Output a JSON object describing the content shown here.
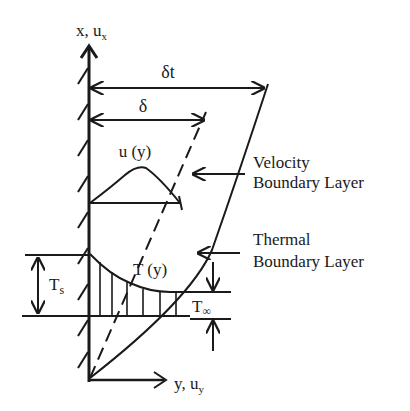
{
  "diagram": {
    "axes": {
      "vertical": {
        "main": "x, u",
        "sub": "x"
      },
      "horizontal": {
        "main": "y, u",
        "sub": "y"
      }
    },
    "dimensions": {
      "thermal_thickness": "δt",
      "velocity_thickness": "δ"
    },
    "profiles": {
      "velocity": "u (y)",
      "temperature": "T (y)"
    },
    "callouts": {
      "velocity_bl": [
        "Velocity",
        "Boundary Layer"
      ],
      "thermal_bl": [
        "Thermal",
        "Boundary Layer"
      ]
    },
    "temperatures": {
      "surface": {
        "main": "T",
        "sub": "s"
      },
      "freestream": {
        "main": "T",
        "sub": "∞"
      }
    },
    "colors": {
      "ink": "#1a1a1a",
      "background": "#ffffff"
    }
  }
}
